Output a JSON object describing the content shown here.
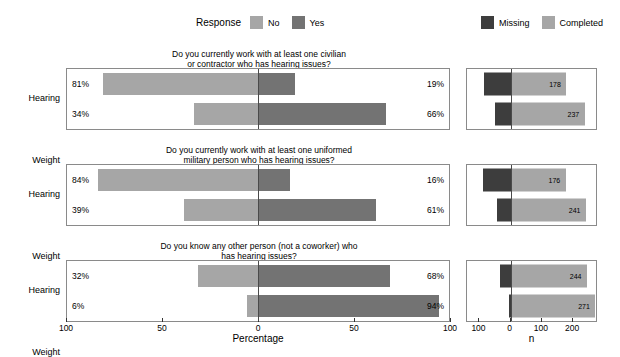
{
  "legends": {
    "response": {
      "title": "Response",
      "items": [
        {
          "label": "No",
          "color": "#a6a6a6",
          "icon": "legend-swatch-no"
        },
        {
          "label": "Yes",
          "color": "#737373",
          "icon": "legend-swatch-yes"
        }
      ]
    },
    "completion": {
      "title": "",
      "items": [
        {
          "label": "Missing",
          "color": "#3d3d3d",
          "icon": "legend-swatch-missing"
        },
        {
          "label": "Completed",
          "color": "#a6a6a6",
          "icon": "legend-swatch-completed"
        }
      ]
    }
  },
  "chart_data": {
    "type": "bar",
    "subtype": "diverging-stacked-likert",
    "title": "",
    "xlabel": "Percentage",
    "ylabel": "",
    "xlim": [
      -100,
      100
    ],
    "grid": false,
    "legend_position": "top",
    "xticks": [
      {
        "value": -100,
        "label": "100"
      },
      {
        "value": -50,
        "label": "50"
      },
      {
        "value": 0,
        "label": "0"
      },
      {
        "value": 50,
        "label": "50"
      },
      {
        "value": 100,
        "label": "100"
      }
    ],
    "categories": [
      "Hearing",
      "Weight"
    ],
    "series": [
      {
        "name": "No",
        "color": "#a6a6a6"
      },
      {
        "name": "Yes",
        "color": "#737373"
      }
    ],
    "panels": [
      {
        "title_line1": "Do you currently work with at least one civilian",
        "title_line2": "or contractor who has hearing issues?",
        "rows": [
          {
            "category": "Hearing",
            "no": 81,
            "yes": 19,
            "no_label": "81%",
            "yes_label": "19%"
          },
          {
            "category": "Weight",
            "no": 34,
            "yes": 66,
            "no_label": "34%",
            "yes_label": "66%"
          }
        ]
      },
      {
        "title_line1": "Do you currently work with at least one uniformed",
        "title_line2": "military person who has hearing issues?",
        "rows": [
          {
            "category": "Hearing",
            "no": 84,
            "yes": 16,
            "no_label": "84%",
            "yes_label": "16%"
          },
          {
            "category": "Weight",
            "no": 39,
            "yes": 61,
            "no_label": "39%",
            "yes_label": "61%"
          }
        ]
      },
      {
        "title_line1": "Do you know any other person (not a coworker) who",
        "title_line2": "has hearing issues?",
        "rows": [
          {
            "category": "Hearing",
            "no": 32,
            "yes": 68,
            "no_label": "32%",
            "yes_label": "68%"
          },
          {
            "category": "Weight",
            "no": 6,
            "yes": 94,
            "no_label": "6%",
            "yes_label": "94%"
          }
        ]
      }
    ]
  },
  "chart_data_right": {
    "type": "bar",
    "subtype": "diverging-counts",
    "xlabel": "n",
    "ylabel": "",
    "xlim": [
      -140,
      280
    ],
    "grid": false,
    "legend_position": "top",
    "xticks": [
      {
        "value": -100,
        "label": "100"
      },
      {
        "value": 0,
        "label": "0"
      },
      {
        "value": 100,
        "label": "100"
      },
      {
        "value": 200,
        "label": "200"
      }
    ],
    "categories": [
      "Hearing",
      "Weight"
    ],
    "series": [
      {
        "name": "Missing",
        "color": "#3d3d3d"
      },
      {
        "name": "Completed",
        "color": "#a6a6a6"
      }
    ],
    "panels": [
      {
        "rows": [
          {
            "category": "Hearing",
            "missing": 86,
            "completed": 178,
            "completed_label": "178"
          },
          {
            "category": "Weight",
            "missing": 49,
            "completed": 237,
            "completed_label": "237"
          }
        ]
      },
      {
        "rows": [
          {
            "category": "Hearing",
            "missing": 88,
            "completed": 176,
            "completed_label": "176"
          },
          {
            "category": "Weight",
            "missing": 45,
            "completed": 241,
            "completed_label": "241"
          }
        ]
      },
      {
        "rows": [
          {
            "category": "Hearing",
            "missing": 34,
            "completed": 244,
            "completed_label": "244"
          },
          {
            "category": "Weight",
            "missing": 6,
            "completed": 271,
            "completed_label": "271"
          }
        ]
      }
    ]
  }
}
